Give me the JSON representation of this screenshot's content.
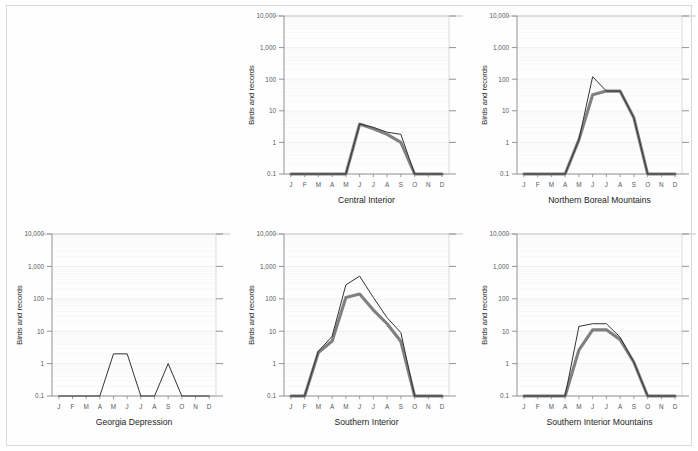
{
  "page": {
    "background_color": "#ffffff",
    "border_color": "#d8d8d8",
    "layout": "2 rows x 3 columns grid of small-multiple charts; top-left cell empty"
  },
  "axis": {
    "y_label": "Birds and records",
    "y_ticks": [
      "10,000",
      "1,000",
      "100",
      "10",
      "1",
      "0.1"
    ],
    "y_tick_values": [
      10000,
      1000,
      100,
      10,
      1,
      0.1
    ],
    "x_ticks": [
      "J",
      "F",
      "M",
      "A",
      "M",
      "J",
      "J",
      "A",
      "S",
      "O",
      "N",
      "D"
    ]
  },
  "style": {
    "thin_line_color": "#333333",
    "thick_line_color": "#808080",
    "grid_color": "#ececec",
    "axis_color": "#888888",
    "minor_grid_color": "#f4f4f4"
  },
  "chart_data": [
    {
      "type": "line",
      "title": "Central Interior",
      "xlabel": "",
      "ylabel": "Birds and records",
      "categories": [
        "J",
        "F",
        "M",
        "A",
        "M",
        "J",
        "J",
        "A",
        "S",
        "O",
        "N",
        "D"
      ],
      "ylim": [
        0.1,
        10000
      ],
      "yscale": "log",
      "grid": true,
      "legend": "none",
      "series": [
        {
          "name": "records",
          "style": "thin",
          "color": "#333333",
          "values": [
            0.1,
            0.1,
            0.1,
            0.1,
            0.1,
            3.8,
            3.0,
            2.1,
            1.8,
            0.1,
            0.1,
            0.1
          ]
        },
        {
          "name": "birds",
          "style": "thick",
          "color": "#808080",
          "values": [
            0.1,
            0.1,
            0.1,
            0.1,
            0.1,
            3.8,
            2.7,
            1.8,
            1.0,
            0.1,
            0.1,
            0.1
          ]
        }
      ]
    },
    {
      "type": "line",
      "title": "Northern Boreal Mountains",
      "xlabel": "",
      "ylabel": "Birds and records",
      "categories": [
        "J",
        "F",
        "M",
        "A",
        "M",
        "J",
        "J",
        "A",
        "S",
        "O",
        "N",
        "D"
      ],
      "ylim": [
        0.1,
        10000
      ],
      "yscale": "log",
      "grid": true,
      "legend": "none",
      "series": [
        {
          "name": "records",
          "style": "thin",
          "color": "#333333",
          "values": [
            0.1,
            0.1,
            0.1,
            0.1,
            1.2,
            120,
            42,
            42,
            6.0,
            0.1,
            0.1,
            0.1
          ]
        },
        {
          "name": "birds",
          "style": "thick",
          "color": "#808080",
          "values": [
            0.1,
            0.1,
            0.1,
            0.1,
            1.2,
            32,
            42,
            42,
            6.0,
            0.1,
            0.1,
            0.1
          ]
        }
      ]
    },
    {
      "type": "line",
      "title": "Georgia Depression",
      "xlabel": "",
      "ylabel": "Birds and records",
      "categories": [
        "J",
        "F",
        "M",
        "A",
        "M",
        "J",
        "J",
        "A",
        "S",
        "O",
        "N",
        "D"
      ],
      "ylim": [
        0.1,
        10000
      ],
      "yscale": "log",
      "grid": true,
      "legend": "none",
      "series": [
        {
          "name": "records",
          "style": "thin",
          "color": "#333333",
          "values": [
            0.1,
            0.1,
            0.1,
            0.1,
            2.0,
            2.0,
            0.1,
            0.1,
            1.0,
            0.1,
            0.1,
            0.1
          ]
        }
      ]
    },
    {
      "type": "line",
      "title": "Southern Interior",
      "xlabel": "",
      "ylabel": "Birds and records",
      "categories": [
        "J",
        "F",
        "M",
        "A",
        "M",
        "J",
        "J",
        "A",
        "S",
        "O",
        "N",
        "D"
      ],
      "ylim": [
        0.1,
        10000
      ],
      "yscale": "log",
      "grid": true,
      "legend": "none",
      "series": [
        {
          "name": "records",
          "style": "thin",
          "color": "#333333",
          "values": [
            0.1,
            0.1,
            2.4,
            7.0,
            270,
            500,
            110,
            26,
            9.0,
            0.1,
            0.1,
            0.1
          ]
        },
        {
          "name": "birds",
          "style": "thick",
          "color": "#808080",
          "values": [
            0.1,
            0.1,
            2.2,
            5.0,
            110,
            140,
            45,
            17,
            4.8,
            0.1,
            0.1,
            0.1
          ]
        }
      ]
    },
    {
      "type": "line",
      "title": "Southern Interior Mountains",
      "xlabel": "",
      "ylabel": "Birds and records",
      "categories": [
        "J",
        "F",
        "M",
        "A",
        "M",
        "J",
        "J",
        "A",
        "S",
        "O",
        "N",
        "D"
      ],
      "ylim": [
        0.1,
        10000
      ],
      "yscale": "log",
      "grid": true,
      "legend": "none",
      "series": [
        {
          "name": "records",
          "style": "thin",
          "color": "#333333",
          "values": [
            0.1,
            0.1,
            0.1,
            0.1,
            14,
            17,
            17,
            6.5,
            1.1,
            0.1,
            0.1,
            0.1
          ]
        },
        {
          "name": "birds",
          "style": "thick",
          "color": "#808080",
          "values": [
            0.1,
            0.1,
            0.1,
            0.1,
            2.6,
            11,
            11,
            5.5,
            1.1,
            0.1,
            0.1,
            0.1
          ]
        }
      ]
    }
  ]
}
